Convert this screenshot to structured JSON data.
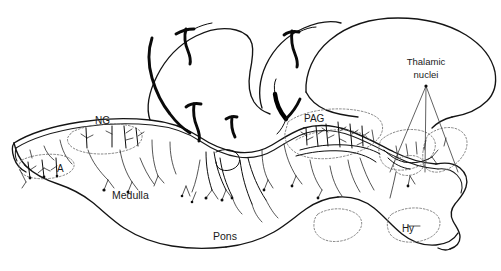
{
  "figure": {
    "background_color": "#ffffff",
    "line_color": "#141414",
    "nucleus_outline_color": "#6f6f6f",
    "width": 501,
    "height": 271
  },
  "labels": {
    "thalamic_nuclei": "Thalamic\nnuclei",
    "thalamic_nuclei_line1": "Thalamic",
    "thalamic_nuclei_line2": "nuclei",
    "pag": "PAG",
    "ng": "NG",
    "a": "A",
    "medulla": "Medulla",
    "pons": "Pons",
    "hy": "Hy"
  },
  "structures": [
    {
      "name": "Thalamic nuclei",
      "abbr": "Thalamic nuclei",
      "leader_lines": 3
    },
    {
      "name": "Periaqueductal gray",
      "abbr": "PAG"
    },
    {
      "name": "Nucleus gracilis",
      "abbr": "NG"
    },
    {
      "name": "A group",
      "abbr": "A"
    },
    {
      "name": "Medulla",
      "abbr": "Medulla"
    },
    {
      "name": "Pons",
      "abbr": "Pons"
    },
    {
      "name": "Hypothalamus",
      "abbr": "Hy"
    }
  ]
}
